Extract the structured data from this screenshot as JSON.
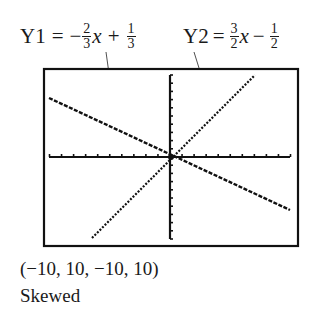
{
  "equations": {
    "y1": {
      "label": "Y1",
      "eq": "=",
      "sign": "−",
      "a_num": "2",
      "a_den": "3",
      "var": "x",
      "op": "+",
      "b_num": "1",
      "b_den": "3"
    },
    "y2": {
      "label": "Y2",
      "eq": "=",
      "sign": "",
      "a_num": "3",
      "a_den": "2",
      "var": "x",
      "op": "−",
      "b_num": "1",
      "b_den": "2"
    }
  },
  "caption": {
    "window": "(−10, 10, −10, 10)",
    "note": "Skewed"
  },
  "chart_data": {
    "type": "line",
    "title": "",
    "xlabel": "",
    "ylabel": "",
    "xlim": [
      -10,
      10
    ],
    "ylim": [
      -10,
      10
    ],
    "grid": false,
    "tick_spacing": 1,
    "aspect": "skewed (non-square window)",
    "series": [
      {
        "name": "Y1 = −(2/3)x + 1/3",
        "slope": -0.6667,
        "intercept": 0.3333,
        "x": [
          -10,
          10
        ],
        "y": [
          7,
          -6.33
        ]
      },
      {
        "name": "Y2 = (3/2)x − 1/2",
        "slope": 1.5,
        "intercept": -0.5,
        "x": [
          -6.33,
          7
        ],
        "y": [
          -10,
          10
        ]
      }
    ],
    "annotations": [
      "Y1 = −(2/3)x + 1/3",
      "Y2 = (3/2)x − 1/2"
    ],
    "window_label": "(−10, 10, −10, 10)",
    "note": "Skewed"
  }
}
